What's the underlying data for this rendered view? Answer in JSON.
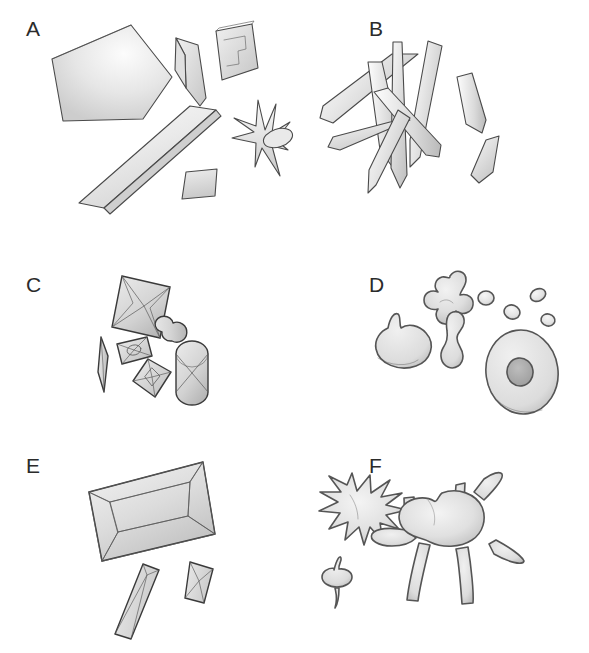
{
  "figure": {
    "background_color": "#ffffff",
    "width": 589,
    "height": 653,
    "outline_color": "#4a4a4a",
    "fill_light": "#f2f2f2",
    "fill_mid": "#d8d8d8",
    "fill_dark": "#b4b4b4"
  },
  "panels": [
    {
      "id": "A",
      "label": "A",
      "label_x": 26,
      "label_y": 24,
      "morphology": "plates and tabular fragments",
      "objects": [
        "large-pentagonal-plate",
        "folded-chevron-sheet",
        "rectangular-plate-with-inclusion",
        "long-tabular-slab",
        "small-parallelogram-plate",
        "star-burst-rosette-with-lobe"
      ]
    },
    {
      "id": "B",
      "label": "B",
      "label_x": 369,
      "label_y": 24,
      "morphology": "acicular needle and lath prisms",
      "objects": [
        "needle-upper-left",
        "needle-vertical-left",
        "needle-vertical-right",
        "needle-diagonal-long",
        "needle-diagonal-short",
        "needle-lower-left",
        "lath-right-upper",
        "lath-right-lower"
      ]
    },
    {
      "id": "C",
      "label": "C",
      "label_x": 26,
      "label_y": 280,
      "morphology": "bipyramidal and capsule crystals with cross facets",
      "objects": [
        "large-square-bipyramid",
        "thin-lens-spindle",
        "small-prism-with-cross",
        "small-bipyramid-with-cross",
        "dumbbell-aggregate",
        "capsule-with-cross"
      ]
    },
    {
      "id": "D",
      "label": "D",
      "label_x": 369,
      "label_y": 280,
      "morphology": "rounded amorphous blobs and droplets",
      "objects": [
        "lobed-clover-blob",
        "droplet-1",
        "droplet-2",
        "droplet-3",
        "kidney-teardrop-blob",
        "peanut-blob",
        "torus-disc-with-central-pit"
      ]
    },
    {
      "id": "E",
      "label": "E",
      "label_x": 26,
      "label_y": 457,
      "morphology": "rectangular prismatic crystals with bevelled faces",
      "objects": [
        "large-rectangular-prism",
        "small-prism-left",
        "small-prism-right"
      ]
    },
    {
      "id": "F",
      "label": "F",
      "label_x": 369,
      "label_y": 457,
      "morphology": "spiculated and branching aggregates",
      "objects": [
        "spiky-sun-sphere",
        "small-winged-nodule",
        "branching-amoeboid-aggregate"
      ]
    }
  ]
}
